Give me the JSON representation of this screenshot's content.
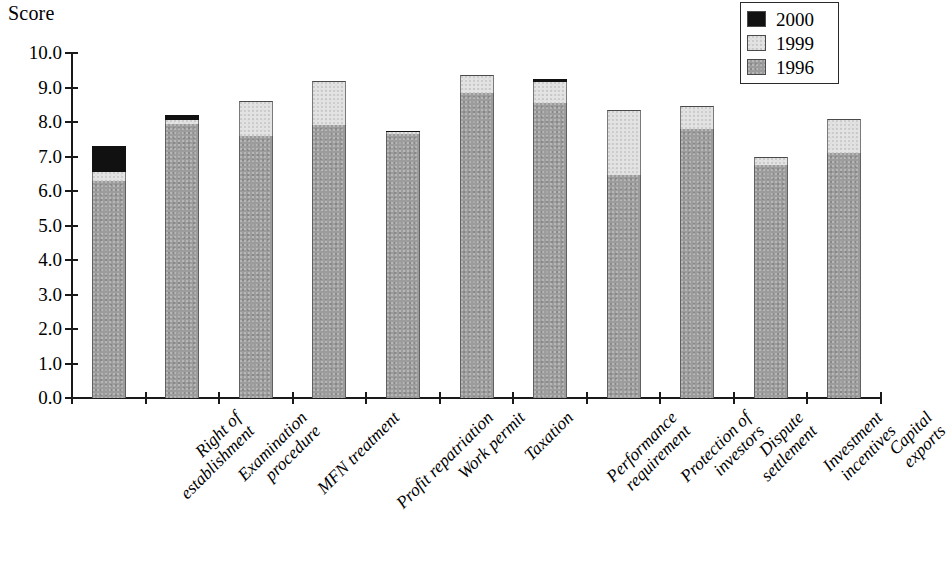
{
  "chart_data": {
    "type": "bar",
    "subtype": "stacked",
    "title": "",
    "ylabel": "Score",
    "xlabel": "",
    "ylim": [
      0.0,
      10.0
    ],
    "ytick_step": 1.0,
    "ytick_labels": [
      "10.0",
      "9.0",
      "8.0",
      "7.0",
      "6.0",
      "5.0",
      "4.0",
      "3.0",
      "2.0",
      "1.0",
      "0.0"
    ],
    "grid": false,
    "legend_position": "top-right",
    "categories": [
      "Right of establishment",
      "Examination procedure",
      "MFN treatment",
      "Profit repatriation",
      "Work permit",
      "Taxation",
      "Performance requirement",
      "Protection of investors",
      "Dispute settlement",
      "Investment incentives",
      "Capital exports"
    ],
    "category_lines": [
      [
        "Right of",
        "establishment"
      ],
      [
        "Examination",
        "procedure"
      ],
      [
        "MFN treatment"
      ],
      [
        "Profit repatriation"
      ],
      [
        "Work permit"
      ],
      [
        "Taxation"
      ],
      [
        "Performance",
        "requirement"
      ],
      [
        "Protection of",
        "investors"
      ],
      [
        "Dispute",
        "settlement"
      ],
      [
        "Investment",
        "incentives"
      ],
      [
        "Capital",
        "exports"
      ]
    ],
    "series": [
      {
        "name": "1996",
        "color": "#9c9c9c",
        "values": [
          6.3,
          7.95,
          7.6,
          7.9,
          7.65,
          8.85,
          8.55,
          6.45,
          7.8,
          6.75,
          7.1
        ]
      },
      {
        "name": "1999",
        "color": "#e3e3e3",
        "values": [
          0.25,
          0.1,
          1.0,
          1.3,
          0.05,
          0.5,
          0.6,
          1.9,
          0.65,
          0.25,
          1.0
        ]
      },
      {
        "name": "2000",
        "color": "#111111",
        "values": [
          0.75,
          0.15,
          0.0,
          0.0,
          0.05,
          0.0,
          0.1,
          0.0,
          0.0,
          0.0,
          0.0
        ]
      }
    ],
    "totals": [
      7.3,
      8.2,
      8.6,
      9.2,
      7.75,
      9.35,
      9.25,
      8.35,
      8.45,
      7.0,
      8.1
    ]
  },
  "legend": {
    "entries": [
      {
        "label": "2000",
        "color": "#111111"
      },
      {
        "label": "1999",
        "color": "#e3e3e3"
      },
      {
        "label": "1996",
        "color": "#9c9c9c"
      }
    ]
  }
}
